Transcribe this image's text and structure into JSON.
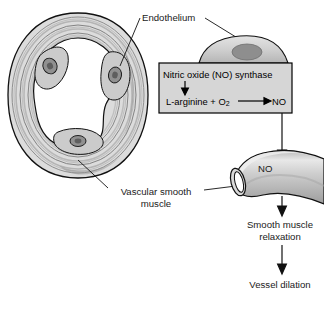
{
  "figure": {
    "background_color": "#ffffff",
    "width": 324,
    "height": 313
  },
  "labels": {
    "endothelium": "Endothelium",
    "vascular_smooth_muscle": "Vascular smooth muscle",
    "no_on_tube": "NO",
    "smooth_muscle_relaxation": "Smooth muscle relaxation",
    "vessel_dilation": "Vessel dilation"
  },
  "reaction_box": {
    "enzyme": "Nitric oxide (NO) synthase",
    "substrate": "L-arginine + O",
    "substrate_subscript": "2",
    "product": "NO",
    "fill_color": "#d6d6d6",
    "border_color": "#000000"
  },
  "colors": {
    "text": "#1a1a1a",
    "outline": "#111111",
    "muscle_light": "#e3e3e3",
    "muscle_mid": "#c4c4c4",
    "muscle_dark": "#9a9a9a",
    "nucleus": "#8c8c8c",
    "lumen": "#ffffff",
    "cell_fill": "#cfcfcf",
    "tube_fill": "#c9c9c9",
    "tube_highlight": "#e6e6e6"
  },
  "flow": {
    "steps": [
      "Nitric oxide (NO) synthase",
      "L-arginine + O2 → NO",
      "NO",
      "Smooth muscle relaxation",
      "Vessel dilation"
    ]
  }
}
